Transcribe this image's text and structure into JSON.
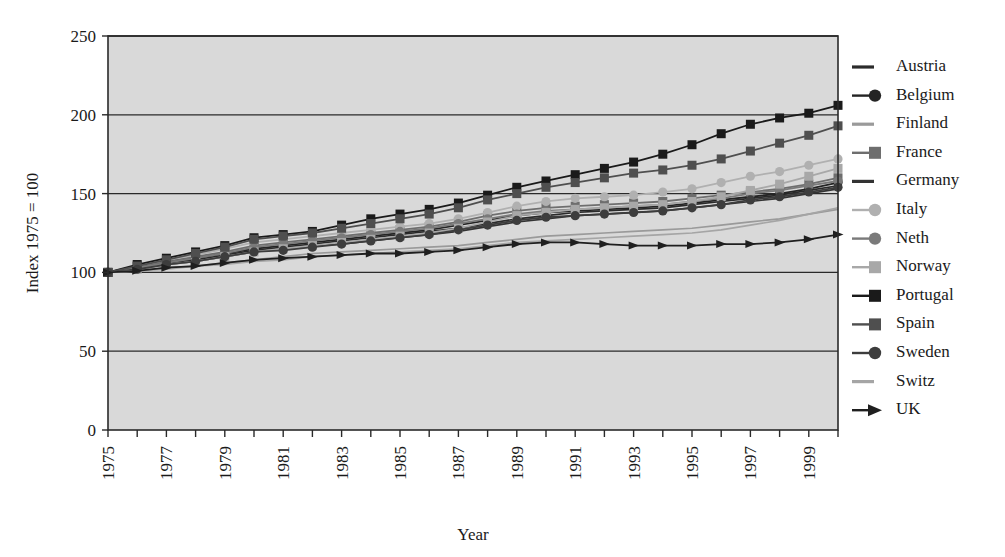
{
  "chart_data": {
    "type": "line",
    "title": "",
    "subtitle": "",
    "xlabel": "Year",
    "ylabel": "Index 1975 = 100",
    "xlim": [
      1975,
      2000
    ],
    "ylim": [
      0,
      250
    ],
    "yticks": [
      0,
      50,
      100,
      150,
      200,
      250
    ],
    "xticks": [
      1975,
      1976,
      1977,
      1978,
      1979,
      1980,
      1981,
      1982,
      1983,
      1984,
      1985,
      1986,
      1987,
      1988,
      1989,
      1990,
      1991,
      1992,
      1993,
      1994,
      1995,
      1996,
      1997,
      1998,
      1999,
      2000
    ],
    "xtick_labels": [
      "1975",
      "",
      "1977",
      "",
      "1979",
      "",
      "1981",
      "",
      "1983",
      "",
      "1985",
      "",
      "1987",
      "",
      "1989",
      "",
      "1991",
      "",
      "1993",
      "",
      "1995",
      "",
      "1997",
      "",
      "1999",
      ""
    ],
    "grid": "horizontal",
    "legend_position": "right",
    "plot_background": "#d9d9d9",
    "x": [
      1975,
      1976,
      1977,
      1978,
      1979,
      1980,
      1981,
      1982,
      1983,
      1984,
      1985,
      1986,
      1987,
      1988,
      1989,
      1990,
      1991,
      1992,
      1993,
      1994,
      1995,
      1996,
      1997,
      1998,
      1999,
      2000
    ],
    "series": [
      {
        "name": "Austria",
        "marker": "none",
        "color": "#2b2b2b",
        "values": [
          100,
          103,
          106,
          108,
          111,
          114,
          116,
          118,
          120,
          122,
          124,
          126,
          128,
          131,
          134,
          136,
          138,
          139,
          140,
          141,
          143,
          145,
          147,
          149,
          152,
          155
        ]
      },
      {
        "name": "Belgium",
        "marker": "circle",
        "color": "#242424",
        "values": [
          100,
          103,
          106,
          109,
          112,
          115,
          117,
          119,
          121,
          123,
          125,
          127,
          130,
          133,
          136,
          138,
          139,
          140,
          141,
          142,
          144,
          146,
          148,
          150,
          153,
          157
        ]
      },
      {
        "name": "Finland",
        "marker": "none",
        "color": "#9a9a9a",
        "values": [
          100,
          101,
          103,
          104,
          106,
          108,
          110,
          112,
          113,
          114,
          115,
          116,
          117,
          119,
          121,
          123,
          124,
          125,
          126,
          127,
          128,
          130,
          132,
          134,
          137,
          140
        ]
      },
      {
        "name": "France",
        "marker": "square",
        "color": "#6e6e6e",
        "values": [
          100,
          104,
          107,
          110,
          113,
          117,
          119,
          121,
          123,
          125,
          127,
          129,
          132,
          136,
          139,
          141,
          142,
          143,
          144,
          145,
          147,
          149,
          151,
          153,
          156,
          160
        ]
      },
      {
        "name": "Germany",
        "marker": "none",
        "color": "#333333",
        "values": [
          100,
          102,
          105,
          107,
          110,
          113,
          115,
          117,
          118,
          120,
          122,
          124,
          126,
          129,
          132,
          134,
          136,
          137,
          138,
          139,
          141,
          143,
          145,
          147,
          150,
          153
        ]
      },
      {
        "name": "Italy",
        "marker": "circle",
        "color": "#b0b0b0",
        "values": [
          100,
          104,
          108,
          111,
          115,
          119,
          121,
          123,
          125,
          127,
          129,
          131,
          134,
          138,
          142,
          145,
          147,
          148,
          149,
          151,
          153,
          157,
          161,
          164,
          168,
          172
        ]
      },
      {
        "name": "Neth",
        "marker": "circle",
        "color": "#7a7a7a",
        "values": [
          100,
          103,
          106,
          109,
          112,
          116,
          118,
          120,
          122,
          124,
          126,
          128,
          131,
          134,
          137,
          139,
          140,
          141,
          142,
          143,
          145,
          147,
          150,
          152,
          155,
          158
        ]
      },
      {
        "name": "Norway",
        "marker": "square",
        "color": "#a8a8a8",
        "values": [
          100,
          102,
          105,
          107,
          110,
          113,
          115,
          117,
          119,
          121,
          123,
          125,
          128,
          132,
          136,
          138,
          140,
          141,
          142,
          143,
          145,
          148,
          152,
          156,
          161,
          166
        ]
      },
      {
        "name": "Portugal",
        "marker": "square",
        "color": "#1a1a1a",
        "values": [
          100,
          105,
          109,
          113,
          117,
          122,
          124,
          126,
          130,
          134,
          137,
          140,
          144,
          149,
          154,
          158,
          162,
          166,
          170,
          175,
          181,
          188,
          194,
          198,
          201,
          206
        ]
      },
      {
        "name": "Spain",
        "marker": "square",
        "color": "#4f4f4f",
        "values": [
          100,
          104,
          108,
          112,
          116,
          121,
          123,
          125,
          128,
          131,
          134,
          137,
          141,
          146,
          150,
          154,
          157,
          160,
          163,
          165,
          168,
          172,
          177,
          182,
          187,
          193
        ]
      },
      {
        "name": "Sweden",
        "marker": "circle",
        "color": "#3d3d3d",
        "values": [
          100,
          102,
          105,
          107,
          110,
          113,
          114,
          116,
          118,
          120,
          122,
          124,
          127,
          130,
          133,
          135,
          136,
          137,
          138,
          139,
          141,
          143,
          146,
          148,
          151,
          154
        ]
      },
      {
        "name": "Switz",
        "marker": "none",
        "color": "#a5a5a5",
        "values": [
          100,
          101,
          102,
          104,
          105,
          107,
          108,
          110,
          111,
          112,
          113,
          114,
          115,
          117,
          119,
          120,
          121,
          122,
          123,
          124,
          125,
          127,
          130,
          133,
          137,
          141
        ]
      },
      {
        "name": "UK",
        "marker": "arrow",
        "color": "#1f1f1f",
        "values": [
          100,
          101,
          103,
          104,
          106,
          108,
          109,
          110,
          111,
          112,
          112,
          113,
          114,
          116,
          118,
          119,
          119,
          118,
          117,
          117,
          117,
          118,
          118,
          119,
          121,
          124
        ]
      }
    ]
  },
  "legend": {
    "entries": [
      {
        "label": "Austria"
      },
      {
        "label": "Belgium"
      },
      {
        "label": "Finland"
      },
      {
        "label": "France"
      },
      {
        "label": "Germany"
      },
      {
        "label": "Italy"
      },
      {
        "label": "Neth"
      },
      {
        "label": "Norway"
      },
      {
        "label": "Portugal"
      },
      {
        "label": "Spain"
      },
      {
        "label": "Sweden"
      },
      {
        "label": "Switz"
      },
      {
        "label": "UK"
      }
    ]
  }
}
